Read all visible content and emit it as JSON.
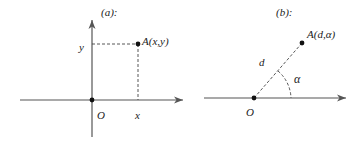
{
  "panels": [
    {
      "id": "a",
      "title": "(a):",
      "type": "cartesian-coordinates",
      "point_label": "A(x,y)",
      "origin_label": "O",
      "x_label": "x",
      "y_label": "y"
    },
    {
      "id": "b",
      "title": "(b):",
      "type": "polar-coordinates",
      "point_label": "A(d,α)",
      "origin_label": "O",
      "distance_label": "d",
      "angle_label": "α"
    }
  ],
  "colors": {
    "axis": "#555555",
    "dashed": "#444444",
    "point": "#111111",
    "text": "#222222"
  }
}
